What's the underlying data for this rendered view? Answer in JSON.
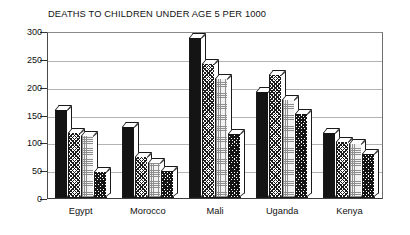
{
  "chart_data": {
    "type": "bar",
    "title": "DEATHS TO CHILDREN UNDER AGE 5 PER 1000",
    "xlabel": "",
    "ylabel": "",
    "ylim": [
      0,
      300
    ],
    "yticks": [
      0,
      50,
      100,
      150,
      200,
      250,
      300
    ],
    "grid": true,
    "legend": "none",
    "categories": [
      "Egypt",
      "Morocco",
      "Mali",
      "Uganda",
      "Kenya"
    ],
    "series": [
      {
        "name": "series-1",
        "pattern": "solid",
        "values": [
          160,
          130,
          290,
          192,
          118
        ]
      },
      {
        "name": "series-2",
        "pattern": "hatch",
        "values": [
          118,
          75,
          243,
          222,
          103
        ]
      },
      {
        "name": "series-3",
        "pattern": "stipple",
        "values": [
          113,
          65,
          215,
          178,
          98
        ]
      },
      {
        "name": "series-4",
        "pattern": "checker",
        "values": [
          48,
          50,
          117,
          152,
          80
        ]
      }
    ],
    "colors": {
      "solid": "#141414",
      "hatch": "#1c1c1c",
      "stipple": "#8e8e8e",
      "checker": "#141414",
      "axis": "#333333",
      "grid": "#b4b4b4",
      "background": "#ffffff",
      "text": "#111111"
    }
  }
}
